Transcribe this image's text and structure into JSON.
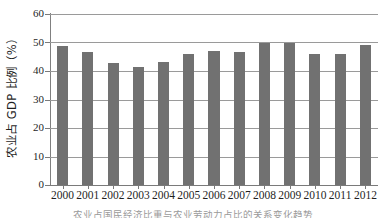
{
  "chart_data": {
    "type": "bar",
    "title": "",
    "xlabel": "",
    "ylabel": "农业占 GDP 比例（%）",
    "categories": [
      "2000",
      "2001",
      "2002",
      "2003",
      "2004",
      "2005",
      "2006",
      "2007",
      "2008",
      "2009",
      "2010",
      "2011",
      "2012"
    ],
    "values": [
      48.7,
      46.8,
      42.7,
      41.3,
      43.3,
      45.8,
      47.0,
      46.5,
      49.7,
      49.9,
      46.1,
      46.1,
      49.3
    ],
    "ylim": [
      0,
      60
    ],
    "yticks": [
      0,
      10,
      20,
      30,
      40,
      50,
      60
    ],
    "ytick_labels": [
      "0",
      "10",
      "20",
      "30",
      "40",
      "50",
      "60"
    ],
    "grid": true,
    "grid_axis": "y",
    "legend": false,
    "legend_position": "none",
    "bar_color": "#717171",
    "gridline_color": "#9a9a9a",
    "axis_color": "#7a7a7a",
    "background_color": "#ffffff"
  },
  "caption": {
    "text": "农业占国民经济比重与农业劳动力占比的关系变化趋势"
  }
}
